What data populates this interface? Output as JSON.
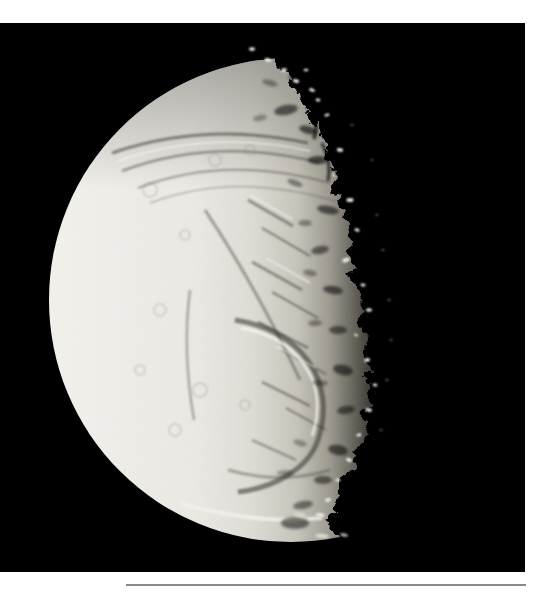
{
  "figure_description": "Black-and-white spacecraft photograph of an icy moon against black space, illuminated from the left; bright smooth limb at left, heavily fractured and cratered surface with parallel canyon grooves, and a ragged speckled terminator fading to black at the right. A thin gray horizontal rule sits on the white page below the photo.",
  "page": {
    "background_color": "#ffffff"
  },
  "photo": {
    "background_color": "#000000",
    "moon": {
      "limb_color": "#f6f5f1",
      "bright_color": "#eeede8",
      "midtone_color": "#e0ded7",
      "falloff_color": "#c6c3b9",
      "terminator_color": "#98948a",
      "dusk_color": "#56534b",
      "shadow_color": "#0d0c0a",
      "groove_color": "#45433c",
      "highlight_color": "#fbfaf6",
      "peak_color": "#e9e7e0",
      "dim_peak_color": "#6f6c64"
    }
  },
  "footer_rule": {
    "color": "#8a8a8a"
  }
}
